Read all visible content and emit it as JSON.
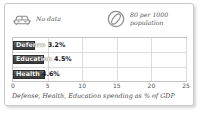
{
  "card": {
    "border_color": "#c9c9c9",
    "background": "#ffffff"
  },
  "header": {
    "stats": [
      {
        "icon": "car-front-icon",
        "text": "No data"
      },
      {
        "icon": "tire-icon",
        "text": "80 per 1000\npopulation"
      }
    ]
  },
  "chart_data": {
    "type": "bar",
    "orientation": "horizontal",
    "title": "",
    "caption": "Defense, Health, Education spending as % of GDP",
    "xlabel": "",
    "ylabel": "",
    "xlim": [
      0,
      25
    ],
    "xticks": [
      "0",
      "5",
      "10",
      "15",
      "20",
      "25"
    ],
    "xtick_values": [
      0,
      5,
      10,
      15,
      20,
      25
    ],
    "grid": true,
    "legend": "none",
    "bar_color": "#4a4a4a",
    "categories": [
      "Defense",
      "Education",
      "Health"
    ],
    "values": [
      3.2,
      4.5,
      4.6
    ],
    "labels": [
      "Defense 3.2%",
      "Education 4.5%",
      "Health 4.6%"
    ],
    "value_labels": [
      "3.2%",
      "4.5%",
      "4.6%"
    ]
  }
}
